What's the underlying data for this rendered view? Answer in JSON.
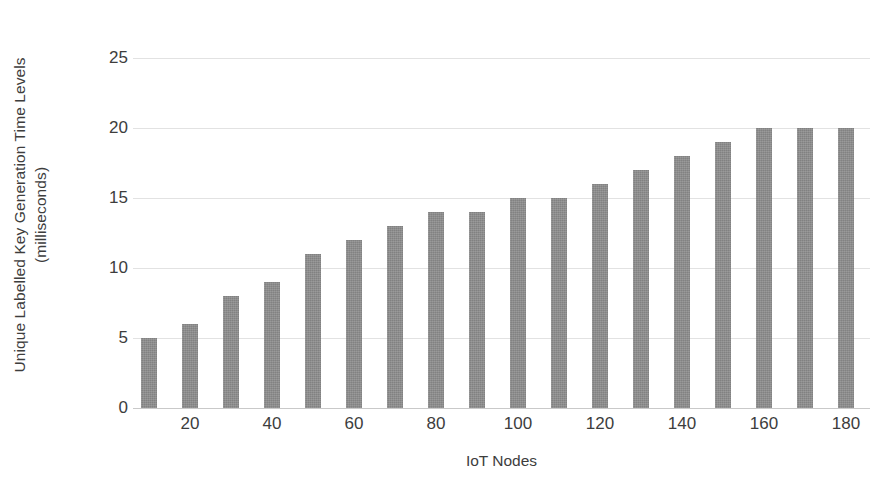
{
  "chart_data": {
    "type": "bar",
    "title": "",
    "xlabel": "IoT Nodes",
    "ylabel": "Unique Labelled Key Generation Time Levels (milliseconds)",
    "ylabel_line1": "Unique Labelled Key Generation Time Levels",
    "ylabel_line2": "(milliseconds)",
    "categories": [
      10,
      20,
      30,
      40,
      50,
      60,
      70,
      80,
      90,
      100,
      110,
      120,
      130,
      140,
      150,
      160,
      170,
      180
    ],
    "values": [
      5,
      6,
      8,
      9,
      11,
      12,
      13,
      14,
      14,
      15,
      15,
      16,
      17,
      18,
      19,
      20,
      20,
      20
    ],
    "series": [
      {
        "name": "Unique Labelled Key Generation Time",
        "values": [
          5,
          6,
          8,
          9,
          11,
          12,
          13,
          14,
          14,
          15,
          15,
          16,
          17,
          18,
          19,
          20,
          20,
          20
        ]
      }
    ],
    "ylim": [
      0,
      25
    ],
    "yticks": [
      0,
      5,
      10,
      15,
      20,
      25
    ],
    "ytick_labels": [
      "0",
      "5",
      "10",
      "15",
      "20",
      "25"
    ],
    "xticks": [
      20,
      40,
      60,
      80,
      100,
      120,
      140,
      160,
      180
    ],
    "xtick_labels": [
      "20",
      "40",
      "60",
      "80",
      "100",
      "120",
      "140",
      "160",
      "180"
    ],
    "grid": true,
    "grid_axis": "y",
    "legend": false,
    "legend_position": "none",
    "bar_color": "#8e8e8e",
    "grid_color": "#e2e2e2",
    "axis_color": "#c9c9c9",
    "text_color": "#3d3d3d",
    "background": "#ffffff"
  }
}
